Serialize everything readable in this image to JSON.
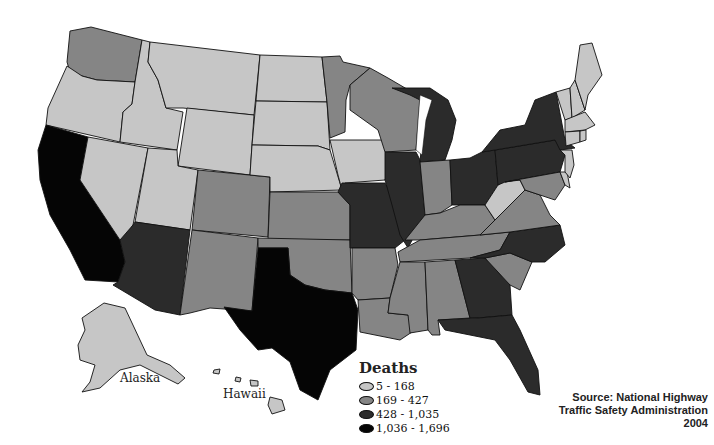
{
  "map": {
    "title": "Traffic Deaths by State",
    "year": "2004",
    "labels": {
      "alaska": "Alaska",
      "hawaii": "Hawaii"
    }
  },
  "legend": {
    "title": "Deaths",
    "items": [
      {
        "range": "5 - 168",
        "color": "#c6c6c6"
      },
      {
        "range": "169 - 427",
        "color": "#858585"
      },
      {
        "range": "428 - 1,035",
        "color": "#2b2b2b"
      },
      {
        "range": "1,036 - 1,696",
        "color": "#050505"
      }
    ]
  },
  "source": {
    "line1": "Source: National Highway",
    "line2": "Traffic Safety Administration",
    "line3": "2004"
  },
  "states": {
    "5-168": [
      "Oregon",
      "Idaho",
      "Montana",
      "Wyoming",
      "Nevada",
      "Utah",
      "North Dakota",
      "South Dakota",
      "Nebraska",
      "Iowa",
      "West Virginia",
      "Maine",
      "Vermont",
      "New Hampshire",
      "Massachusetts",
      "Rhode Island",
      "Connecticut",
      "New Jersey",
      "Delaware",
      "Alaska",
      "Hawaii"
    ],
    "169-427": [
      "Washington",
      "Colorado",
      "New Mexico",
      "Kansas",
      "Oklahoma",
      "Minnesota",
      "Wisconsin",
      "Arkansas",
      "Louisiana",
      "Indiana",
      "Kentucky",
      "Tennessee",
      "Mississippi",
      "Alabama",
      "South Carolina",
      "Virginia",
      "Maryland"
    ],
    "428-1035": [
      "Arizona",
      "Missouri",
      "Illinois",
      "Michigan",
      "Ohio",
      "Pennsylvania",
      "New York",
      "North Carolina",
      "Georgia",
      "Florida"
    ],
    "1036-1696": [
      "California",
      "Texas"
    ]
  }
}
